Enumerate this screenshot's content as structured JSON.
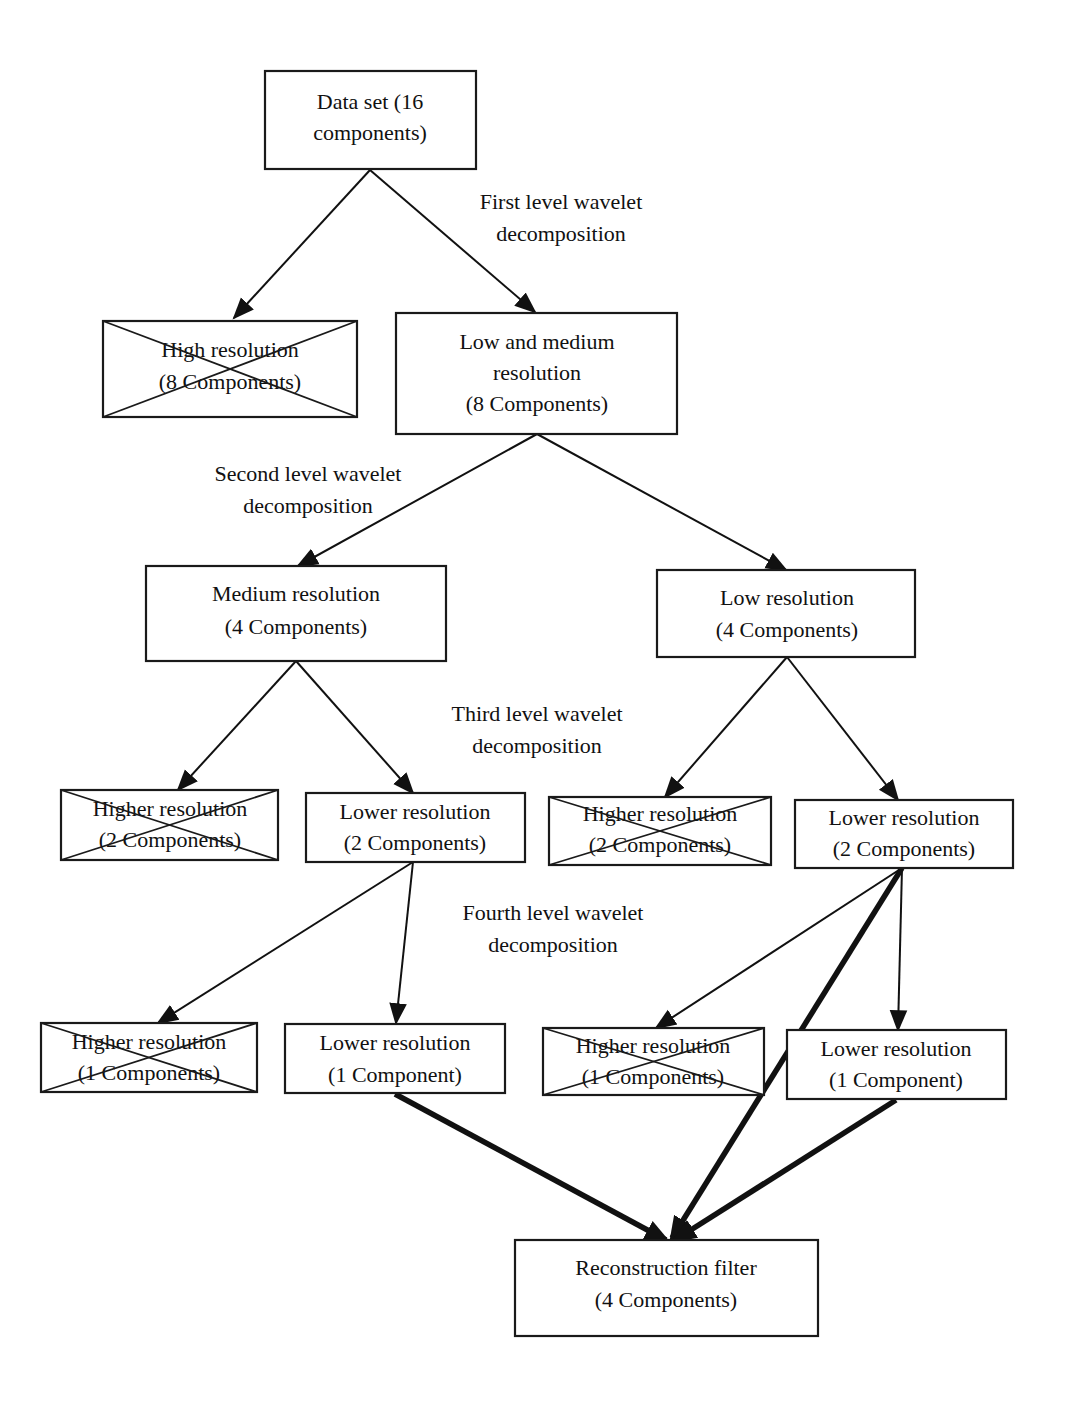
{
  "diagram": {
    "level_labels": [
      {
        "id": "level1",
        "lines": [
          "First level wavelet",
          "decomposition"
        ]
      },
      {
        "id": "level2",
        "lines": [
          "Second level wavelet",
          "decomposition"
        ]
      },
      {
        "id": "level3",
        "lines": [
          "Third level wavelet",
          "decomposition"
        ]
      },
      {
        "id": "level4",
        "lines": [
          "Fourth level wavelet",
          "decomposition"
        ]
      }
    ],
    "nodes": [
      {
        "id": "dataset",
        "lines": [
          "Data set (16",
          "components)"
        ],
        "discarded": false
      },
      {
        "id": "high",
        "lines": [
          "High resolution",
          "(8 Components)"
        ],
        "discarded": true
      },
      {
        "id": "lowmed",
        "lines": [
          "Low and medium",
          "resolution",
          "(8 Components)"
        ],
        "discarded": false
      },
      {
        "id": "medium",
        "lines": [
          "Medium resolution",
          "(4 Components)"
        ],
        "discarded": false
      },
      {
        "id": "low",
        "lines": [
          "Low resolution",
          "(4 Components)"
        ],
        "discarded": false
      },
      {
        "id": "m_higher",
        "lines": [
          "Higher resolution",
          "(2 Components)"
        ],
        "discarded": true
      },
      {
        "id": "m_lower",
        "lines": [
          "Lower resolution",
          "(2 Components)"
        ],
        "discarded": false
      },
      {
        "id": "l_higher",
        "lines": [
          "Higher resolution",
          "(2 Components)"
        ],
        "discarded": true
      },
      {
        "id": "l_lower",
        "lines": [
          "Lower resolution",
          "(2 Components)"
        ],
        "discarded": false
      },
      {
        "id": "mm_higher",
        "lines": [
          "Higher resolution",
          "(1 Components)"
        ],
        "discarded": true
      },
      {
        "id": "mm_lower",
        "lines": [
          "Lower resolution",
          "(1 Component)"
        ],
        "discarded": false
      },
      {
        "id": "ll_higher",
        "lines": [
          "Higher resolution",
          "(1 Components)"
        ],
        "discarded": true
      },
      {
        "id": "ll_lower",
        "lines": [
          "Lower resolution",
          "(1 Component)"
        ],
        "discarded": false
      },
      {
        "id": "recon",
        "lines": [
          "Reconstruction filter",
          "(4 Components)"
        ],
        "discarded": false
      }
    ],
    "edges": [
      {
        "from": "dataset",
        "to": "high",
        "style": "normal"
      },
      {
        "from": "dataset",
        "to": "lowmed",
        "style": "normal"
      },
      {
        "from": "lowmed",
        "to": "medium",
        "style": "normal"
      },
      {
        "from": "lowmed",
        "to": "low",
        "style": "normal"
      },
      {
        "from": "medium",
        "to": "m_higher",
        "style": "normal"
      },
      {
        "from": "medium",
        "to": "m_lower",
        "style": "normal"
      },
      {
        "from": "low",
        "to": "l_higher",
        "style": "normal"
      },
      {
        "from": "low",
        "to": "l_lower",
        "style": "normal"
      },
      {
        "from": "m_lower",
        "to": "mm_higher",
        "style": "normal"
      },
      {
        "from": "m_lower",
        "to": "mm_lower",
        "style": "normal"
      },
      {
        "from": "l_lower",
        "to": "ll_higher",
        "style": "normal"
      },
      {
        "from": "l_lower",
        "to": "ll_lower",
        "style": "normal"
      },
      {
        "from": "mm_lower",
        "to": "recon",
        "style": "bold"
      },
      {
        "from": "l_lower",
        "to": "recon",
        "style": "bold"
      },
      {
        "from": "ll_lower",
        "to": "recon",
        "style": "bold"
      }
    ]
  }
}
